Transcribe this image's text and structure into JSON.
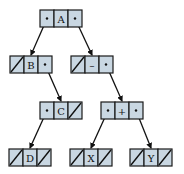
{
  "diagram": {
    "type": "binary-tree-linked-nodes",
    "colors": {
      "cell_fill": "#c9d7e2",
      "stroke": "#1a1a1a",
      "background": "#ffffff"
    },
    "cell_size": {
      "w": 14,
      "h": 17
    },
    "nodes": [
      {
        "id": "A",
        "label": "A",
        "x": 40,
        "y": 10,
        "left": "ptr",
        "right": "ptr"
      },
      {
        "id": "B",
        "label": "B",
        "x": 10,
        "y": 56,
        "left": "null",
        "right": "ptr"
      },
      {
        "id": "minus",
        "label": "–",
        "x": 71,
        "y": 56,
        "left": "null",
        "right": "ptr"
      },
      {
        "id": "C",
        "label": "C",
        "x": 40,
        "y": 102,
        "left": "ptr",
        "right": "null"
      },
      {
        "id": "plus",
        "label": "+",
        "x": 101,
        "y": 102,
        "left": "ptr",
        "right": "ptr"
      },
      {
        "id": "D",
        "label": "D",
        "x": 9,
        "y": 149,
        "left": "null",
        "right": "null"
      },
      {
        "id": "X",
        "label": "X",
        "x": 70,
        "y": 149,
        "left": "null",
        "right": "null"
      },
      {
        "id": "Y",
        "label": "Y",
        "x": 130,
        "y": 149,
        "left": "null",
        "right": "null"
      }
    ],
    "edges": [
      {
        "from": "A",
        "side": "left",
        "to": "B"
      },
      {
        "from": "A",
        "side": "right",
        "to": "minus"
      },
      {
        "from": "B",
        "side": "right",
        "to": "C"
      },
      {
        "from": "minus",
        "side": "right",
        "to": "plus"
      },
      {
        "from": "C",
        "side": "left",
        "to": "D"
      },
      {
        "from": "plus",
        "side": "left",
        "to": "X"
      },
      {
        "from": "plus",
        "side": "right",
        "to": "Y"
      }
    ]
  }
}
